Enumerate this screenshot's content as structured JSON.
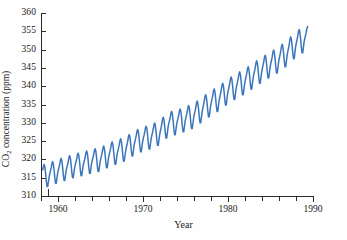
{
  "chart_data": {
    "type": "line",
    "title": "",
    "subtitle": "",
    "xlabel": "Year",
    "ylabel": "CO2 concentration (ppm)",
    "ylabel_parts": {
      "prefix": "CO",
      "sub": "2",
      "suffix": " concentration (ppm)"
    },
    "series_name": "Mauna Loa monthly mean CO2",
    "line_color": "#3b76bc",
    "grid": false,
    "legend": "none",
    "xlim": [
      1958,
      1990
    ],
    "ylim": [
      310,
      360
    ],
    "y_ticks": [
      310,
      315,
      320,
      325,
      330,
      335,
      340,
      345,
      350,
      355,
      360
    ],
    "y_tick_labels": [
      "310",
      "315",
      "320",
      "325",
      "330",
      "335",
      "340",
      "345",
      "350",
      "355",
      "360"
    ],
    "x_ticks": [
      1958,
      1960,
      1962,
      1964,
      1966,
      1968,
      1970,
      1972,
      1974,
      1976,
      1978,
      1980,
      1982,
      1984,
      1986,
      1988,
      1990
    ],
    "x_tick_labels": [
      "",
      "1960",
      "",
      "",
      "",
      "",
      "1970",
      "",
      "",
      "",
      "",
      "1980",
      "",
      "",
      "",
      "",
      "1990"
    ],
    "x_major_ticks": [
      1960,
      1970,
      1980,
      1990
    ],
    "annual_trend": [
      {
        "year": 1958,
        "value": 315.3
      },
      {
        "year": 1959,
        "value": 315.9
      },
      {
        "year": 1960,
        "value": 316.9
      },
      {
        "year": 1961,
        "value": 317.6
      },
      {
        "year": 1962,
        "value": 318.4
      },
      {
        "year": 1963,
        "value": 318.9
      },
      {
        "year": 1964,
        "value": 319.6
      },
      {
        "year": 1965,
        "value": 320.0
      },
      {
        "year": 1966,
        "value": 321.3
      },
      {
        "year": 1967,
        "value": 322.1
      },
      {
        "year": 1968,
        "value": 323.0
      },
      {
        "year": 1969,
        "value": 324.6
      },
      {
        "year": 1970,
        "value": 325.6
      },
      {
        "year": 1971,
        "value": 326.3
      },
      {
        "year": 1972,
        "value": 327.4
      },
      {
        "year": 1973,
        "value": 329.7
      },
      {
        "year": 1974,
        "value": 330.2
      },
      {
        "year": 1975,
        "value": 331.1
      },
      {
        "year": 1976,
        "value": 332.0
      },
      {
        "year": 1977,
        "value": 333.8
      },
      {
        "year": 1978,
        "value": 335.4
      },
      {
        "year": 1979,
        "value": 336.8
      },
      {
        "year": 1980,
        "value": 338.7
      },
      {
        "year": 1981,
        "value": 340.1
      },
      {
        "year": 1982,
        "value": 341.4
      },
      {
        "year": 1983,
        "value": 343.0
      },
      {
        "year": 1984,
        "value": 344.6
      },
      {
        "year": 1985,
        "value": 346.0
      },
      {
        "year": 1986,
        "value": 347.4
      },
      {
        "year": 1987,
        "value": 349.2
      },
      {
        "year": 1988,
        "value": 351.6
      },
      {
        "year": 1989,
        "value": 352.9
      }
    ],
    "seasonal_cycle": {
      "description": "Annual sawtooth: May maximum, September/October minimum",
      "amplitude_ppm_start": 6.0,
      "amplitude_ppm_end": 6.6,
      "peak_month": 5,
      "trough_month": 9,
      "monthly_offsets_ppm": [
        0.2,
        0.9,
        1.7,
        2.7,
        3.1,
        2.3,
        0.6,
        -1.5,
        -3.1,
        -3.2,
        -1.9,
        -0.6
      ]
    }
  }
}
